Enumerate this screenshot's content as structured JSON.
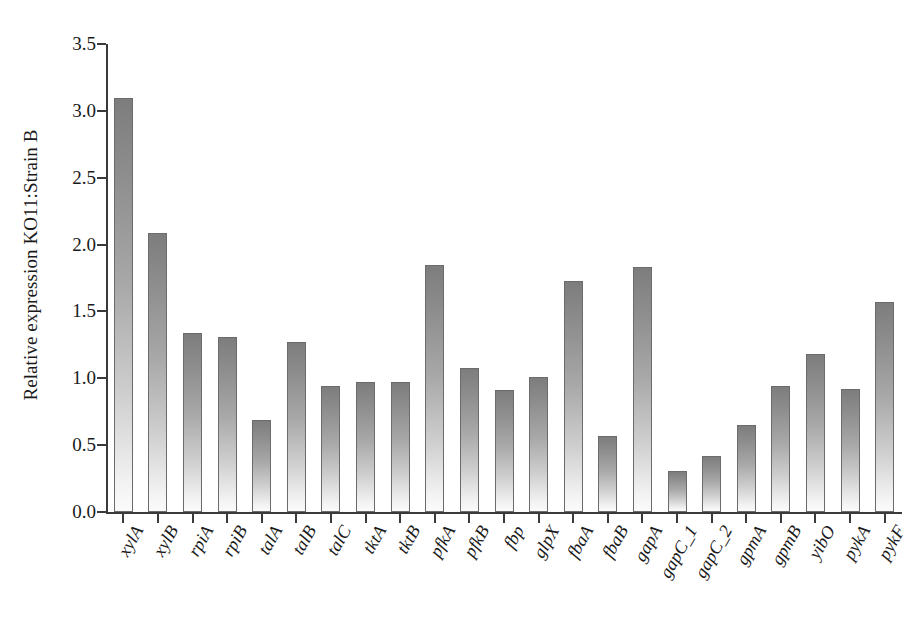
{
  "chart_data": {
    "type": "bar",
    "title": "",
    "xlabel": "",
    "ylabel": "Relative expression KO11:Strain B",
    "ylim": [
      0.0,
      3.5
    ],
    "yticks": [
      "0.0",
      "0.5",
      "1.0",
      "1.5",
      "2.0",
      "2.5",
      "3.0",
      "3.5"
    ],
    "ytick_values": [
      0.0,
      0.5,
      1.0,
      1.5,
      2.0,
      2.5,
      3.0,
      3.5
    ],
    "grid": false,
    "legend": "none",
    "italic_categories": true,
    "categories": [
      "xylA",
      "xylB",
      "rpiA",
      "rpiB",
      "talA",
      "talB",
      "talC",
      "tktA",
      "tktB",
      "pfkA",
      "pfkB",
      "fbp",
      "glpX",
      "fbaA",
      "fbaB",
      "gapA",
      "gapC_1",
      "gapC_2",
      "gpmA",
      "gpmB",
      "yibO",
      "pykA",
      "pykF"
    ],
    "values": [
      3.1,
      2.09,
      1.34,
      1.31,
      0.69,
      1.27,
      0.94,
      0.97,
      0.97,
      1.85,
      1.08,
      0.91,
      1.01,
      1.73,
      0.57,
      1.83,
      0.31,
      0.42,
      0.65,
      0.94,
      1.18,
      0.92,
      1.57
    ],
    "bar_color_top": "#7d7d7d",
    "bar_color_bottom": "#fbfbfb",
    "bar_edge_color": "#6b6b6b",
    "axis_color": "#3a3a3a",
    "background_color": "#ffffff"
  }
}
